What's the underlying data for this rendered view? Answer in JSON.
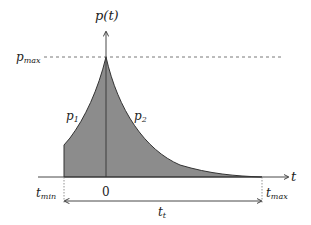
{
  "diagram": {
    "y_axis_label": "p(t)",
    "x_axis_label": "t",
    "pmax_label_main": "p",
    "pmax_label_sub": "max",
    "p1_main": "p",
    "p1_sub": "1",
    "p2_main": "p",
    "p2_sub": "2",
    "tmin_main": "t",
    "tmin_sub": "min",
    "origin_label": "0",
    "tmax_main": "t",
    "tmax_sub": "max",
    "tt_main": "t",
    "tt_sub": "t",
    "fill_color": "#8c8c8c",
    "line_color": "#333333"
  }
}
